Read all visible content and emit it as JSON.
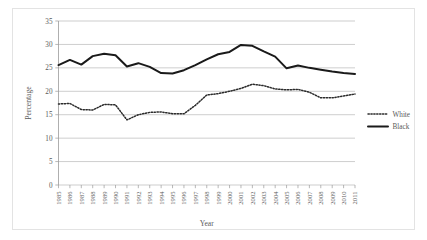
{
  "chart_data": {
    "type": "line",
    "title": "",
    "xlabel": "Year",
    "ylabel": "Percentage",
    "ylim": [
      0,
      35
    ],
    "yticks": [
      0,
      5,
      10,
      15,
      20,
      25,
      30,
      35
    ],
    "grid": true,
    "legend_position": "right",
    "categories": [
      "1985",
      "1986",
      "1987",
      "1988",
      "1989",
      "1990",
      "1991",
      "1992",
      "1993",
      "1994",
      "1995",
      "1996",
      "1997",
      "1998",
      "1999",
      "2000",
      "2001",
      "2002",
      "2003",
      "2004",
      "2005",
      "2006",
      "2007",
      "2008",
      "2009",
      "2010",
      "2011"
    ],
    "series": [
      {
        "name": "White",
        "style": "dotted",
        "color": "#2b2b2b",
        "values": [
          17.3,
          17.4,
          16.1,
          16.0,
          17.2,
          17.1,
          13.9,
          15.0,
          15.5,
          15.6,
          15.2,
          15.2,
          17.0,
          19.2,
          19.5,
          20.0,
          20.6,
          21.5,
          21.2,
          20.5,
          20.3,
          20.4,
          19.8,
          18.6,
          18.6,
          19.0,
          19.4
        ]
      },
      {
        "name": "Black",
        "style": "solid",
        "color": "#1a1a1a",
        "values": [
          25.6,
          26.7,
          25.7,
          27.5,
          28.0,
          27.7,
          25.3,
          26.0,
          25.2,
          23.9,
          23.8,
          24.5,
          25.6,
          26.8,
          27.9,
          28.4,
          29.9,
          29.7,
          28.5,
          27.4,
          24.9,
          25.5,
          25.0,
          24.6,
          24.2,
          23.9,
          23.7
        ]
      }
    ]
  },
  "axis": {
    "ylabel": "Percentage",
    "xlabel": "Year",
    "ytick_labels": [
      "0",
      "5",
      "10",
      "15",
      "20",
      "25",
      "30",
      "35"
    ]
  },
  "legend": {
    "entries": [
      {
        "label": "White"
      },
      {
        "label": "Black"
      }
    ]
  }
}
